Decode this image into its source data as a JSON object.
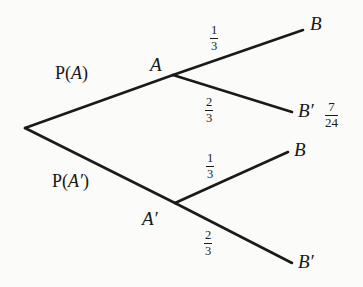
{
  "diagram": {
    "type": "probability-tree",
    "title_text": "",
    "background_color": "#fbfbfa",
    "line_color": "#1a1a1a",
    "text_color": "#171717",
    "root": {
      "name": "root-node",
      "x": 25,
      "y": 128
    },
    "branches": [
      {
        "name": "branch-p-a",
        "label": "P(",
        "label_arg": "A",
        "label_close": ")",
        "label_full": "P(A)",
        "label_x": 55,
        "label_y": 64,
        "from_x": 25,
        "from_y": 128,
        "to_x": 173,
        "to_y": 75
      },
      {
        "name": "branch-p-a-prime",
        "label": "P(",
        "label_arg": "A′",
        "label_close": ")",
        "label_full": "P(A′)",
        "label_x": 52,
        "label_y": 172,
        "from_x": 25,
        "from_y": 128,
        "to_x": 175,
        "to_y": 203
      },
      {
        "name": "branch-a-to-b",
        "fraction_num": "1",
        "fraction_den": "3",
        "fraction_x": 210,
        "fraction_y": 24,
        "from_x": 173,
        "from_y": 75,
        "to_x": 303,
        "to_y": 30
      },
      {
        "name": "branch-a-to-b-prime",
        "fraction_num": "2",
        "fraction_den": "3",
        "fraction_x": 205,
        "fraction_y": 96,
        "from_x": 173,
        "from_y": 75,
        "to_x": 292,
        "to_y": 112
      },
      {
        "name": "branch-a-prime-to-b",
        "fraction_num": "1",
        "fraction_den": "3",
        "fraction_x": 206,
        "fraction_y": 152,
        "from_x": 175,
        "from_y": 203,
        "to_x": 288,
        "to_y": 152
      },
      {
        "name": "branch-a-prime-to-b-prime",
        "fraction_num": "2",
        "fraction_den": "3",
        "fraction_x": 204,
        "fraction_y": 229,
        "from_x": 175,
        "from_y": 203,
        "to_x": 292,
        "to_y": 263
      }
    ],
    "nodes": [
      {
        "name": "node-a",
        "label": "A",
        "x": 150,
        "y": 55
      },
      {
        "name": "node-a-prime",
        "label": "A′",
        "x": 142,
        "y": 209
      }
    ],
    "endpoints": [
      {
        "name": "endpoint-b-top",
        "label": "B",
        "x": 310,
        "y": 14
      },
      {
        "name": "endpoint-b-prime-upper",
        "label": "B′",
        "x": 298,
        "y": 101
      },
      {
        "name": "endpoint-b-lower",
        "label": "B",
        "x": 294,
        "y": 140
      },
      {
        "name": "endpoint-b-prime-bottom",
        "label": "B′",
        "x": 298,
        "y": 252
      }
    ],
    "annotations": [
      {
        "name": "result-fraction",
        "num": "7",
        "den": "24",
        "value_text": "7/24",
        "x": 325,
        "y": 100
      }
    ]
  }
}
